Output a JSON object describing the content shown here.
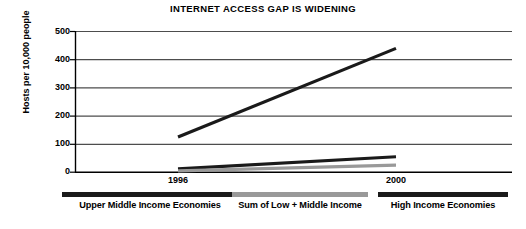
{
  "chart_data": {
    "type": "line",
    "title": "INTERNET ACCESS GAP IS WIDENING",
    "xlabel": "",
    "ylabel": "Hosts per 10,000 people",
    "x": [
      "1996",
      "2000"
    ],
    "xticklabels": [
      "1996",
      "2000"
    ],
    "yticklabels": [
      "0",
      "100",
      "200",
      "300",
      "400",
      "500"
    ],
    "ytickvalues": [
      0,
      100,
      200,
      300,
      400,
      500
    ],
    "ylim": [
      0,
      500
    ],
    "grid": "horizontal",
    "legend_position": "below-axis",
    "series": [
      {
        "name": "High Income Economies",
        "values": [
          125,
          440
        ],
        "color": "#1a1a1a"
      },
      {
        "name": "Upper Middle Income Economies",
        "values": [
          12,
          55
        ],
        "color": "#1a1a1a"
      },
      {
        "name": "Sum of Low + Middle Income",
        "values": [
          5,
          25
        ],
        "color": "#999999"
      }
    ]
  },
  "legend": {
    "items": [
      {
        "label": "Upper Middle Income Economies",
        "color": "#1a1a1a"
      },
      {
        "label": "Sum of Low + Middle Income",
        "color": "#999999"
      },
      {
        "label": "High Income Economies",
        "color": "#1a1a1a"
      }
    ]
  },
  "colors": {
    "axis": "#000000",
    "grid": "#555555",
    "background": "#ffffff",
    "dark_series": "#1a1a1a",
    "gray_series": "#999999"
  }
}
